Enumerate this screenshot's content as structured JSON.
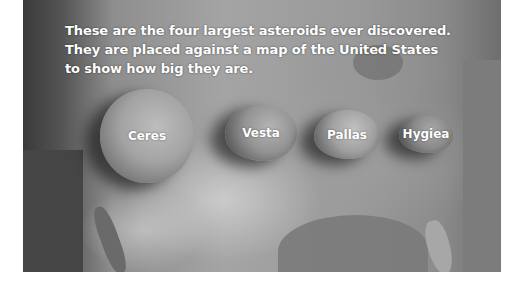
{
  "caption": {
    "lines": [
      "These are the four largest asteroids ever discovered.",
      "They are placed against a map of the United States",
      "to show how big they are."
    ]
  },
  "asteroids": [
    {
      "name": "Ceres"
    },
    {
      "name": "Vesta"
    },
    {
      "name": "Pallas"
    },
    {
      "name": "Hygiea"
    }
  ],
  "background": {
    "subject": "satellite map of the United States",
    "palette": "grayscale"
  }
}
